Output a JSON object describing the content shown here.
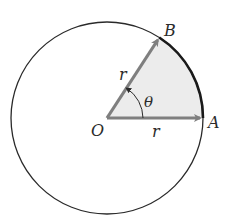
{
  "diagram": {
    "colors": {
      "circle": "#2a2a2a",
      "arc_highlight": "#1a1a1a",
      "radius_arrow": "#7f7f7f",
      "sector_fill": "#ececec",
      "label": "#2b2b2b"
    },
    "geometry": {
      "center": [
        107,
        118
      ],
      "radius": 96,
      "angle_deg": 57
    },
    "labels": {
      "center": "O",
      "point_a": "A",
      "point_b": "B",
      "radius_oa": "r",
      "radius_ob": "r",
      "angle": "θ"
    }
  }
}
